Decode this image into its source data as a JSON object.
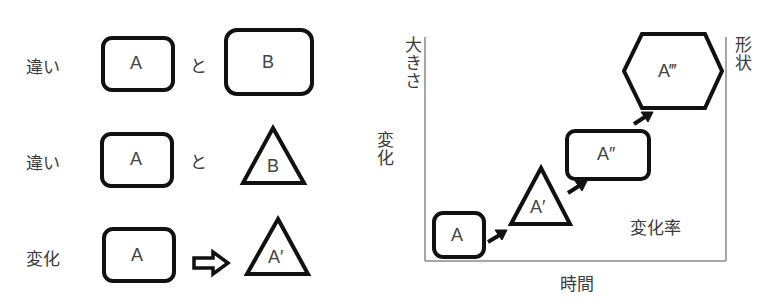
{
  "left_panel": {
    "rows": [
      {
        "label": "違い",
        "shape1": "A",
        "connector": "と",
        "shape2": "B",
        "shape2_type": "rounded-rect-large"
      },
      {
        "label": "違い",
        "shape1": "A",
        "connector": "と",
        "shape2": "B",
        "shape2_type": "triangle"
      },
      {
        "label": "変化",
        "shape1": "A",
        "connector": "⇒",
        "shape2": "A′",
        "shape2_type": "triangle"
      }
    ]
  },
  "right_panel": {
    "y_axis_label_left": "変化",
    "y_axis_label_top": "大きさ",
    "y_axis_label_right": "形状",
    "x_axis_label": "時間",
    "inner_label": "変化率",
    "steps": [
      {
        "label": "A",
        "shape": "rounded-rect"
      },
      {
        "label": "A′",
        "shape": "triangle"
      },
      {
        "label": "A″",
        "shape": "rounded-rect"
      },
      {
        "label": "A‴",
        "shape": "hexagon"
      }
    ]
  }
}
